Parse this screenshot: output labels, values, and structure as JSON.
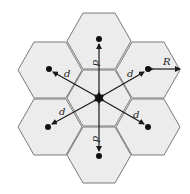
{
  "diagram": {
    "colors": {
      "cell_fill": "#ececec",
      "cell_stroke": "#7a7a7a",
      "arrow": "#1a1a1a",
      "dot": "#111111"
    },
    "cells": [
      {
        "id": "center",
        "cx": 99,
        "cy": 98
      },
      {
        "id": "top",
        "cx": 99,
        "cy": 41
      },
      {
        "id": "upper-right",
        "cx": 148,
        "cy": 70
      },
      {
        "id": "lower-right",
        "cx": 148,
        "cy": 127
      },
      {
        "id": "bottom",
        "cx": 99,
        "cy": 155
      },
      {
        "id": "lower-left",
        "cx": 50,
        "cy": 127
      },
      {
        "id": "upper-left",
        "cx": 50,
        "cy": 70
      }
    ],
    "labels": {
      "d_top": "d",
      "d_upper_right": "d",
      "d_lower_right": "d",
      "d_bottom": "d",
      "d_lower_left": "d",
      "d_upper_left": "d",
      "radius": "R"
    }
  }
}
